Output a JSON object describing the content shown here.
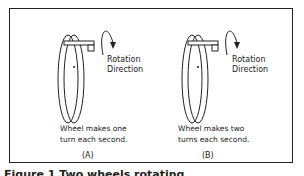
{
  "figure": {
    "panels": [
      {
        "id": "A",
        "rotation_label_1": "Rotation",
        "rotation_label_2": "Direction",
        "description_1": "Wheel makes one",
        "description_2": "turn each second.",
        "label": "(A)"
      },
      {
        "id": "B",
        "rotation_label_1": "Rotation",
        "rotation_label_2": "Direction",
        "description_1": "Wheel makes two",
        "description_2": "turns each second.",
        "label": "(B)"
      }
    ],
    "caption": "Figure 1  Two wheels rotating"
  }
}
